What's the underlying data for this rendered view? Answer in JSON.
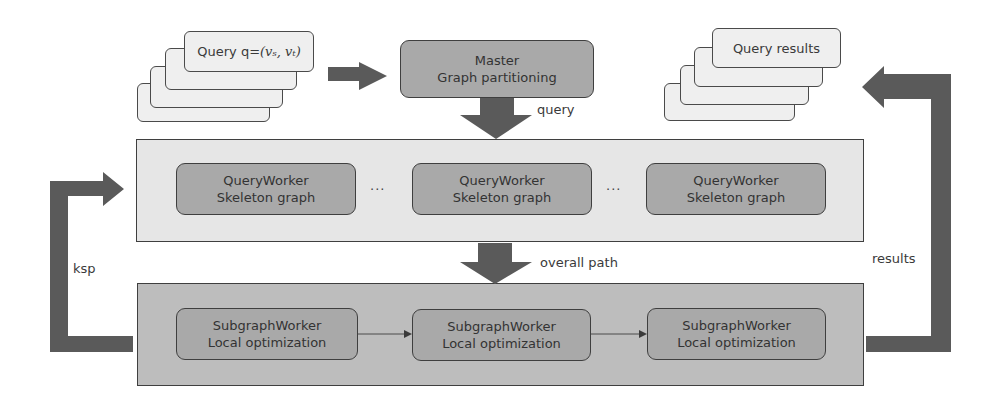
{
  "colors": {
    "arrow": "#5a5a5a",
    "node_fill": "#a9a9a9",
    "top_container_fill": "#e6e6e6",
    "bottom_container_fill": "#bdbdbd",
    "card_fill": "#efefef"
  },
  "query_stack": {
    "label": "Query q=",
    "math": "(v_s, v_t)",
    "math_display": "(𝑣ₛ, 𝑣ₜ)"
  },
  "master": {
    "line1": "Master",
    "line2": "Graph partitioning"
  },
  "results_stack": {
    "label": "Query results"
  },
  "arrows": {
    "query": "query",
    "overall_path": "overall path",
    "ksp": "ksp",
    "results": "results"
  },
  "query_workers": {
    "items": [
      {
        "line1": "QueryWorker",
        "line2": "Skeleton graph"
      },
      {
        "line1": "QueryWorker",
        "line2": "Skeleton graph"
      },
      {
        "line1": "QueryWorker",
        "line2": "Skeleton graph"
      }
    ],
    "ellipsis": "..."
  },
  "subgraph_workers": {
    "items": [
      {
        "line1": "SubgraphWorker",
        "line2": "Local optimization"
      },
      {
        "line1": "SubgraphWorker",
        "line2": "Local optimization"
      },
      {
        "line1": "SubgraphWorker",
        "line2": "Local optimization"
      }
    ]
  }
}
